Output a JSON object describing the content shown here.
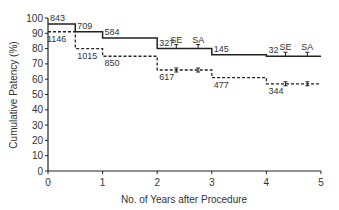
{
  "chart_data": {
    "type": "line",
    "subtype": "kaplan-meier step",
    "title": "",
    "xlabel": "No. of Years after Procedure",
    "ylabel": "Cumulative Patency (%)",
    "xlim": [
      0,
      5
    ],
    "ylim": [
      0,
      100
    ],
    "x_ticks": [
      "0",
      "1",
      "2",
      "3",
      "4",
      "5"
    ],
    "y_ticks": [
      "0",
      "10",
      "20",
      "30",
      "40",
      "50",
      "60",
      "70",
      "80",
      "90",
      "100"
    ],
    "grid": false,
    "legend": "none",
    "series": [
      {
        "name": "solid",
        "style": "solid",
        "steps": [
          {
            "x0": 0,
            "x1": 0.5,
            "y": 96
          },
          {
            "x0": 0.5,
            "x1": 1,
            "y": 91
          },
          {
            "x0": 1,
            "x1": 2,
            "y": 87
          },
          {
            "x0": 2,
            "x1": 3,
            "y": 80
          },
          {
            "x0": 3,
            "x1": 4,
            "y": 76
          },
          {
            "x0": 4,
            "x1": 5,
            "y": 75
          }
        ],
        "at_risk_labels": [
          {
            "x": 0,
            "label": "843"
          },
          {
            "x": 0.5,
            "label": "709"
          },
          {
            "x": 1,
            "label": "584"
          },
          {
            "x": 2,
            "label": "327"
          },
          {
            "x": 3,
            "label": "145"
          },
          {
            "x": 4,
            "label": "32"
          }
        ],
        "error_markers": [
          {
            "x": 2.35,
            "label": "SE"
          },
          {
            "x": 2.75,
            "label": "SA"
          },
          {
            "x": 4.35,
            "label": "SE"
          },
          {
            "x": 4.75,
            "label": "SA"
          }
        ]
      },
      {
        "name": "dashed",
        "style": "dashed",
        "steps": [
          {
            "x0": 0,
            "x1": 0.5,
            "y": 91
          },
          {
            "x0": 0.5,
            "x1": 1,
            "y": 80
          },
          {
            "x0": 1,
            "x1": 2,
            "y": 75
          },
          {
            "x0": 2,
            "x1": 3,
            "y": 66
          },
          {
            "x0": 3,
            "x1": 4,
            "y": 61
          },
          {
            "x0": 4,
            "x1": 5,
            "y": 57
          }
        ],
        "at_risk_labels": [
          {
            "x": 0,
            "label": "1146"
          },
          {
            "x": 0.5,
            "label": "1015"
          },
          {
            "x": 1,
            "label": "850"
          },
          {
            "x": 2,
            "label": "617"
          },
          {
            "x": 3,
            "label": "477"
          },
          {
            "x": 4,
            "label": "344"
          }
        ],
        "error_markers": [
          {
            "x": 2.35
          },
          {
            "x": 2.75
          },
          {
            "x": 4.35
          },
          {
            "x": 4.75
          }
        ]
      }
    ]
  }
}
